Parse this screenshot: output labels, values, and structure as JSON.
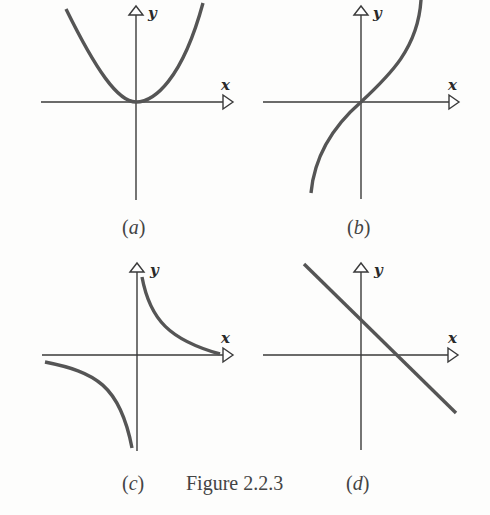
{
  "figure": {
    "caption": "Figure 2.2.3",
    "background": "#fdfdfc",
    "axis_color": "#3a3a3a",
    "curve_color": "#555555"
  },
  "panels": [
    {
      "id": "a",
      "label_open": "(",
      "label_letter": "a",
      "label_close": ")",
      "x_axis_label": "x",
      "y_axis_label": "y",
      "curve_type": "parabola",
      "description": "Upward-opening parabola with vertex at the origin"
    },
    {
      "id": "b",
      "label_open": "(",
      "label_letter": "b",
      "label_close": ")",
      "x_axis_label": "x",
      "y_axis_label": "y",
      "curve_type": "cubic",
      "description": "Increasing S-shaped curve passing through the origin"
    },
    {
      "id": "c",
      "label_open": "(",
      "label_letter": "c",
      "label_close": ")",
      "x_axis_label": "x",
      "y_axis_label": "y",
      "curve_type": "hyperbola",
      "description": "Reciprocal curve with branches in quadrants I and III, asymptotic to both axes"
    },
    {
      "id": "d",
      "label_open": "(",
      "label_letter": "d",
      "label_close": ")",
      "x_axis_label": "x",
      "y_axis_label": "y",
      "curve_type": "line",
      "description": "Straight line with negative slope and positive x- and y-intercepts"
    }
  ]
}
